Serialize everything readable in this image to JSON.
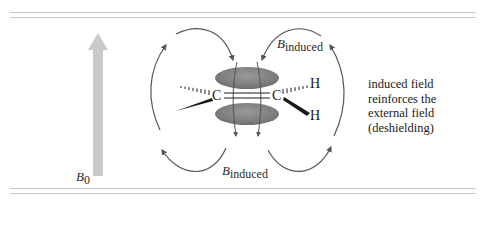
{
  "figure": {
    "external_field_label": {
      "symbol": "B",
      "subscript": "0"
    },
    "induced_field_top_label": {
      "symbol": "B",
      "subscript": "induced"
    },
    "induced_field_bottom_label": {
      "symbol": "B",
      "subscript": "induced"
    },
    "atoms": {
      "carbon_left": "C",
      "carbon_right": "C",
      "hydrogen_top": "H",
      "hydrogen_bottom": "H"
    },
    "annotation": {
      "line1": "induced field",
      "line2": "reinforces the",
      "line3": "external field",
      "line4": "(deshielding)"
    },
    "colors": {
      "external_field_arrow": "#c9c9c9",
      "pi_lobe": "#8a8a8a",
      "field_lines": "#555555",
      "rules": "#c8c8c8"
    }
  }
}
